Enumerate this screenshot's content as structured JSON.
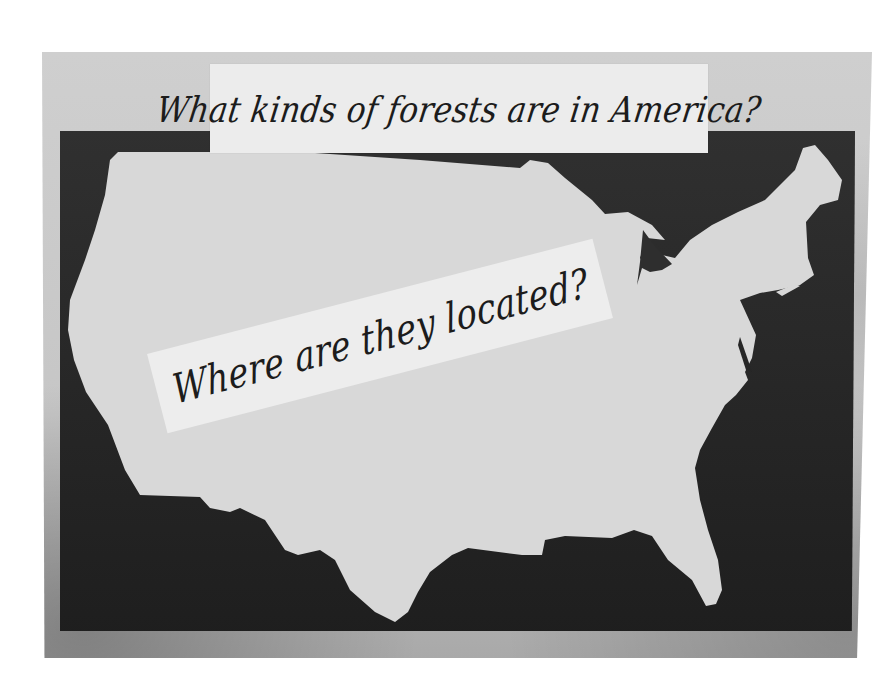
{
  "scene": {
    "description": "Photograph of a classroom bulletin board with a silhouette map of the United States",
    "colors": {
      "board": "#c8c8c8",
      "panel": "#262626",
      "map": "#d9d9d9",
      "card": "#ececec",
      "ink": "#1c1c1c"
    }
  },
  "cards": {
    "top": {
      "text": "What kinds of forests are in America?"
    },
    "center": {
      "text": "Where are they located?"
    }
  },
  "map": {
    "label": "Outline map of the continental United States"
  }
}
